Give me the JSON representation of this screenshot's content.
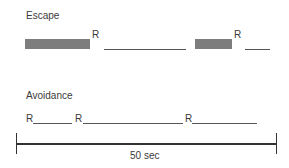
{
  "escape": {
    "title": "Escape",
    "response_marks": [
      "R",
      "R"
    ]
  },
  "avoidance": {
    "title": "Avoidance",
    "response_marks": [
      "R",
      "R",
      "R"
    ]
  },
  "timescale": {
    "label": "50 sec"
  },
  "colors": {
    "shock_bar": "#7d7d7d",
    "line": "#555555",
    "axis": "#333333"
  }
}
